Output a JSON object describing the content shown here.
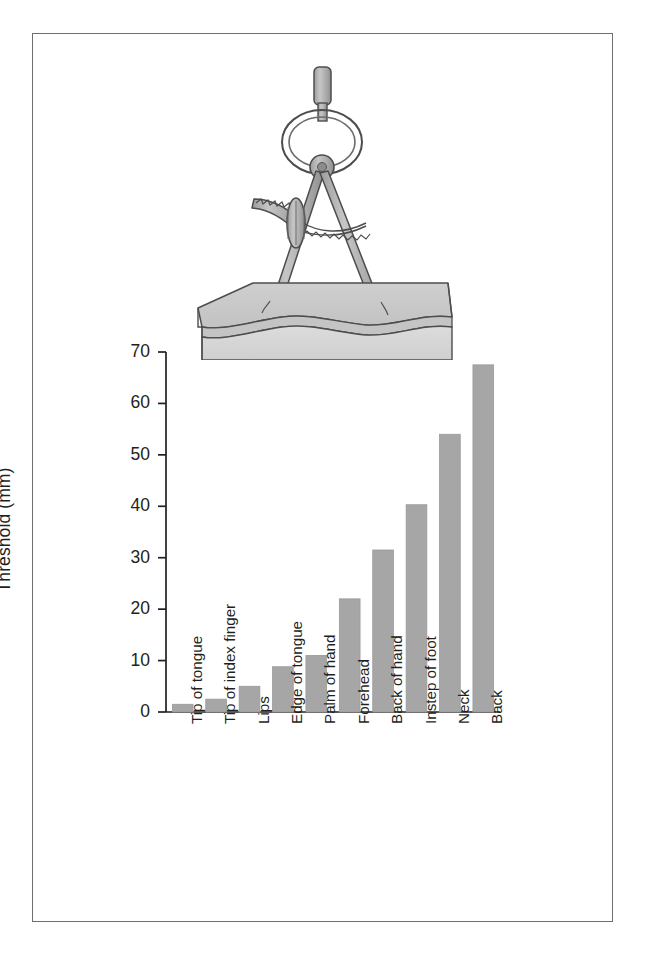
{
  "figure": {
    "caption": "",
    "illustration_name": "two-point-discrimination-caliper"
  },
  "colors": {
    "frame_border": "#6e6e6e",
    "bar_fill": "#a6a6a6",
    "axis": "#231f20",
    "text": "#231f20",
    "caliper_metal": "#b0b0b0",
    "caliper_outline": "#4d4d4d",
    "skin_top": "#c9c9c9",
    "skin_side": "#d6d6d6"
  },
  "chart_data": {
    "type": "bar",
    "title": "",
    "xlabel": "",
    "ylabel": "Threshold (mm)",
    "ylim": [
      0,
      70
    ],
    "yticks": [
      0,
      10,
      20,
      30,
      40,
      50,
      60,
      70
    ],
    "ytick_labels": [
      "0",
      "10",
      "20",
      "30",
      "40",
      "50",
      "60",
      "70"
    ],
    "grid": false,
    "legend": null,
    "categories": [
      "Tip of tongue",
      "Tip of index finger",
      "Lips",
      "Edge of tongue",
      "Palm of hand",
      "Forehead",
      "Back of hand",
      "Instep of foot",
      "Neck",
      "Back"
    ],
    "values": [
      1.5,
      2.5,
      5,
      8.8,
      11,
      22,
      31.5,
      40.3,
      54,
      67.5
    ]
  },
  "axis": {
    "y_label": "Threshold (mm)"
  }
}
